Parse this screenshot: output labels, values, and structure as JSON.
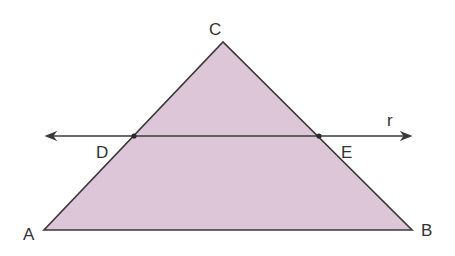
{
  "diagram": {
    "type": "geometry",
    "fill_color": "#dcc6d8",
    "stroke_color": "#3a3a3a",
    "points": {
      "A": {
        "label": "A",
        "x": 44,
        "y": 230
      },
      "B": {
        "label": "B",
        "x": 412,
        "y": 230
      },
      "C": {
        "label": "C",
        "x": 223,
        "y": 42
      },
      "D": {
        "label": "D",
        "x": 134,
        "y": 136
      },
      "E": {
        "label": "E",
        "x": 319,
        "y": 136
      }
    },
    "line": {
      "label": "r",
      "y": 136,
      "x_start": 47,
      "x_end": 410
    }
  }
}
